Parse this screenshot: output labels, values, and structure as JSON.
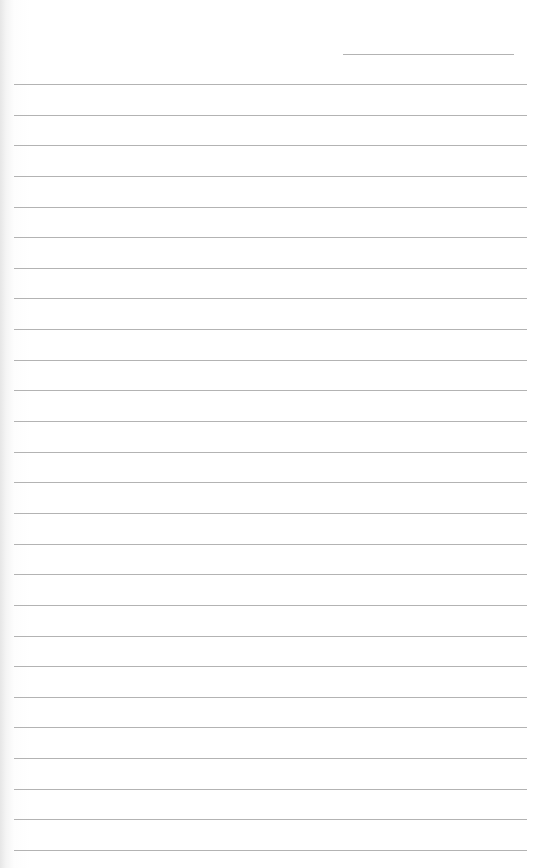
{
  "document": {
    "type": "lined-paper",
    "header_line_count": 1,
    "ruled_line_count": 26,
    "line_color": "#9a9a9a",
    "paper_color": "#ffffff"
  }
}
